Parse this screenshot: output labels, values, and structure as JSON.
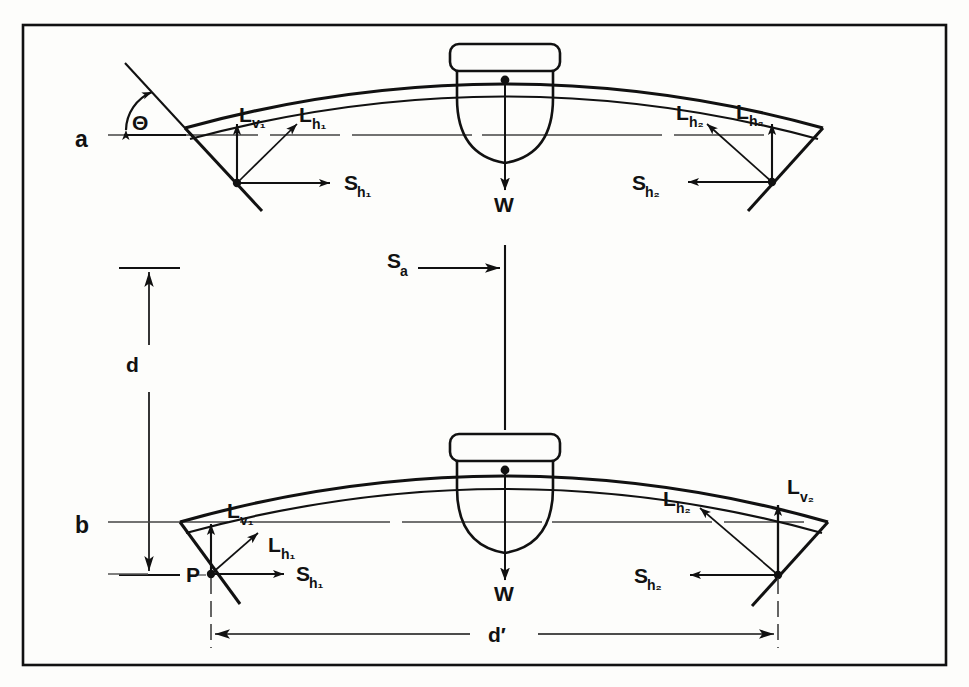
{
  "figure": {
    "frame": {
      "border_color": "#111111"
    },
    "background": "#fdfdfb",
    "rows": [
      {
        "id": "a",
        "label": "a"
      },
      {
        "id": "b",
        "label": "b"
      }
    ],
    "angle_label": "Θ",
    "point_label": "P",
    "load_label_top": "W",
    "load_label_bottom": "W",
    "span_arrow_label": "S",
    "span_arrow_sub": "a",
    "dimension_vertical": "d",
    "dimension_horizontal": "d′",
    "forces_top_left": [
      {
        "name": "L",
        "sub": "v₁",
        "full": "Lv1",
        "dir": "up"
      },
      {
        "name": "L",
        "sub": "h₁",
        "full": "Lh1",
        "dir": "up-right"
      },
      {
        "name": "S",
        "sub": "h₁",
        "full": "Sh1",
        "dir": "right"
      }
    ],
    "forces_top_right": [
      {
        "name": "L",
        "sub": "h₂",
        "full": "Lh2",
        "dir": "up-left"
      },
      {
        "name": "L",
        "sub": "h₂",
        "full": "Lh2",
        "dir": "up"
      },
      {
        "name": "S",
        "sub": "h₂",
        "full": "Sh2",
        "dir": "left"
      }
    ],
    "forces_bottom_left": [
      {
        "name": "L",
        "sub": "v₁",
        "full": "Lv1",
        "dir": "up"
      },
      {
        "name": "L",
        "sub": "h₁",
        "full": "Lh1",
        "dir": "up-right"
      },
      {
        "name": "S",
        "sub": "h₁",
        "full": "Sh1",
        "dir": "right"
      }
    ],
    "forces_bottom_right": [
      {
        "name": "L",
        "sub": "h₂",
        "full": "Lh2",
        "dir": "up-left"
      },
      {
        "name": "L",
        "sub": "v₂",
        "full": "Lv2",
        "dir": "up"
      },
      {
        "name": "S",
        "sub": "h₂",
        "full": "Sh2",
        "dir": "left"
      }
    ],
    "labels": {
      "row_a": "a",
      "row_b": "b",
      "theta": "Θ",
      "P": "P",
      "W_top": "W",
      "W_bottom": "W",
      "S_a_base": "S",
      "S_a_sub": "a",
      "d": "d",
      "d_prime": "d′",
      "Lv1_top_base": "L",
      "Lv1_top_sub": "v₁",
      "Lh1_top_base": "L",
      "Lh1_top_sub": "h₁",
      "Sh1_top_base": "S",
      "Sh1_top_sub": "h₁",
      "Lh2a_top_base": "L",
      "Lh2a_top_sub": "h₂",
      "Lh2b_top_base": "L",
      "Lh2b_top_sub": "h₂",
      "Sh2_top_base": "S",
      "Sh2_top_sub": "h₂",
      "Lv1_bot_base": "L",
      "Lv1_bot_sub": "v₁",
      "Lh1_bot_base": "L",
      "Lh1_bot_sub": "h₁",
      "Sh1_bot_base": "S",
      "Sh1_bot_sub": "h₁",
      "Lh2_bot_base": "L",
      "Lh2_bot_sub": "h₂",
      "Lv2_bot_base": "L",
      "Lv2_bot_sub": "v₂",
      "Sh2_bot_base": "S",
      "Sh2_bot_sub": "h₂"
    }
  }
}
